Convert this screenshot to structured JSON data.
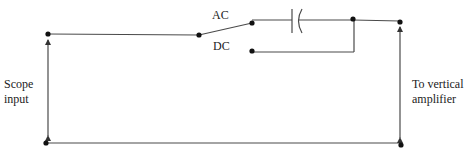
{
  "diagram": {
    "type": "circuit-schematic",
    "labels": {
      "ac": "AC",
      "dc": "DC",
      "scope_input_line1": "Scope",
      "scope_input_line2": "input",
      "vertical_amp_line1": "To vertical",
      "vertical_amp_line2": "amplifier"
    },
    "components": [
      {
        "id": "input-terminal-top",
        "kind": "node"
      },
      {
        "id": "input-terminal-bottom",
        "kind": "node"
      },
      {
        "id": "switch",
        "kind": "spdt-switch",
        "positions": [
          "AC",
          "DC"
        ],
        "selected": "AC"
      },
      {
        "id": "coupling-capacitor",
        "kind": "capacitor",
        "in_path": "AC"
      },
      {
        "id": "dc-bypass",
        "kind": "wire",
        "in_path": "DC"
      },
      {
        "id": "output-terminal-top",
        "kind": "node"
      },
      {
        "id": "output-terminal-bottom",
        "kind": "node"
      }
    ],
    "colors": {
      "wire": "#4a4a4a",
      "node": "#111111",
      "text": "#222222",
      "background": "#ffffff"
    }
  }
}
